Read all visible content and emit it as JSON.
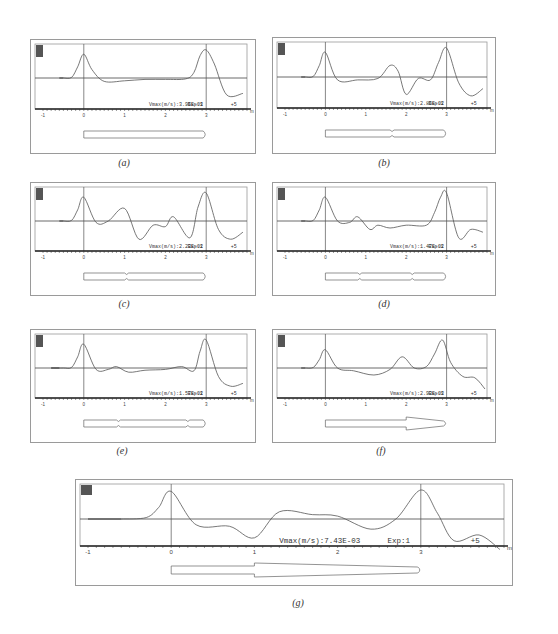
{
  "figure": {
    "panels": [
      {
        "id": "a",
        "caption": "(a)",
        "vmax_label": "Vmax(m/s):3.95E-03",
        "exp_label": "Exp:1",
        "scale_label": "+5",
        "corner_label": "1"
      },
      {
        "id": "b",
        "caption": "(b)",
        "vmax_label": "Vmax(m/s):2.85E-02",
        "exp_label": "Exp:1",
        "scale_label": "+5",
        "corner_label": "1"
      },
      {
        "id": "c",
        "caption": "(c)",
        "vmax_label": "Vmax(m/s):2.23E-02",
        "exp_label": "Exp:1",
        "scale_label": "+5",
        "corner_label": "1"
      },
      {
        "id": "d",
        "caption": "(d)",
        "vmax_label": "Vmax(m/s):1.47E-02",
        "exp_label": "Exp:1",
        "scale_label": "+5",
        "corner_label": "1"
      },
      {
        "id": "e",
        "caption": "(e)",
        "vmax_label": "Vmax(m/s):1.57E-02",
        "exp_label": "Exp:1",
        "scale_label": "+5",
        "corner_label": "1"
      },
      {
        "id": "f",
        "caption": "(f)",
        "vmax_label": "Vmax(m/s):2.93E-03",
        "exp_label": "Exp:1",
        "scale_label": "+5",
        "corner_label": "1"
      },
      {
        "id": "g",
        "caption": "(g)",
        "vmax_label": "Vmax(m/s):7.43E-03",
        "exp_label": "Exp:1",
        "scale_label": "+5",
        "corner_label": "1"
      }
    ],
    "x_ticks": [
      "-1",
      "0",
      "1",
      "2",
      "3",
      "m"
    ]
  },
  "chart_data": [
    {
      "type": "line",
      "title": "(a)",
      "xlabel": "m",
      "xlim": [
        -1,
        4
      ],
      "x_ticks": [
        -1,
        0,
        1,
        2,
        3
      ],
      "annotation": "Vmax(m/s):3.95E-03  Exp:1  +5",
      "series": [
        {
          "name": "velocity",
          "x": [
            -0.5,
            -0.3,
            -0.15,
            0,
            0.2,
            0.5,
            1.0,
            1.5,
            2.0,
            2.5,
            2.7,
            2.85,
            3.0,
            3.2,
            3.5,
            3.9
          ],
          "y": [
            0,
            0.02,
            0.4,
            0.85,
            0.3,
            -0.12,
            -0.1,
            -0.05,
            -0.05,
            -0.03,
            0.2,
            0.8,
            1.0,
            0.5,
            -0.6,
            -0.55
          ]
        }
      ]
    },
    {
      "type": "line",
      "title": "(b)",
      "xlabel": "m",
      "xlim": [
        -1,
        4
      ],
      "x_ticks": [
        -1,
        0,
        1,
        2,
        3
      ],
      "annotation": "Vmax(m/s):2.85E-02  Exp:1  +5",
      "series": [
        {
          "name": "velocity",
          "x": [
            -0.5,
            -0.3,
            -0.15,
            0,
            0.3,
            0.8,
            1.3,
            1.6,
            1.8,
            2.0,
            2.3,
            2.6,
            2.8,
            3.0,
            3.3,
            3.6,
            3.9
          ],
          "y": [
            0,
            0.02,
            0.4,
            0.85,
            -0.1,
            -0.1,
            -0.05,
            0.4,
            0.2,
            -0.6,
            -0.05,
            -0.1,
            0.5,
            1.0,
            -0.2,
            -0.65,
            -0.4
          ]
        }
      ]
    },
    {
      "type": "line",
      "title": "(c)",
      "xlabel": "m",
      "xlim": [
        -1,
        4
      ],
      "x_ticks": [
        -1,
        0,
        1,
        2,
        3
      ],
      "annotation": "Vmax(m/s):2.23E-02  Exp:1  +5",
      "series": [
        {
          "name": "velocity",
          "x": [
            -0.5,
            -0.3,
            -0.15,
            0,
            0.3,
            0.6,
            1.0,
            1.35,
            1.7,
            2.0,
            2.2,
            2.6,
            2.8,
            3.0,
            3.3,
            3.6,
            3.9
          ],
          "y": [
            0,
            0.02,
            0.4,
            0.85,
            -0.05,
            0,
            0.45,
            -0.65,
            -0.15,
            -0.2,
            0.15,
            -0.6,
            0.5,
            1.0,
            -0.3,
            -0.65,
            -0.4
          ]
        }
      ]
    },
    {
      "type": "line",
      "title": "(d)",
      "xlabel": "m",
      "xlim": [
        -1,
        4
      ],
      "x_ticks": [
        -1,
        0,
        1,
        2,
        3
      ],
      "annotation": "Vmax(m/s):1.47E-02  Exp:1  +5",
      "series": [
        {
          "name": "velocity",
          "x": [
            -0.5,
            -0.3,
            -0.15,
            0,
            0.3,
            0.6,
            0.8,
            1.1,
            1.3,
            1.6,
            2.0,
            2.5,
            2.7,
            2.85,
            3.0,
            3.3,
            3.6,
            3.9
          ],
          "y": [
            0,
            0.02,
            0.4,
            0.85,
            0,
            -0.05,
            0.15,
            -0.3,
            -0.15,
            -0.25,
            -0.15,
            -0.15,
            0.3,
            0.85,
            1.0,
            -0.6,
            -0.3,
            -0.4
          ]
        }
      ]
    },
    {
      "type": "line",
      "title": "(e)",
      "xlabel": "m",
      "xlim": [
        -1,
        4
      ],
      "x_ticks": [
        -1,
        0,
        1,
        2,
        3
      ],
      "annotation": "Vmax(m/s):1.57E-02  Exp:1  +5",
      "series": [
        {
          "name": "velocity",
          "x": [
            -0.8,
            -0.5,
            -0.3,
            -0.15,
            0,
            0.3,
            0.6,
            0.8,
            1.1,
            1.5,
            2.0,
            2.4,
            2.7,
            2.85,
            3.0,
            3.3,
            3.6,
            3.9
          ],
          "y": [
            0,
            0,
            0.02,
            0.4,
            0.85,
            -0.05,
            -0.05,
            0.05,
            -0.15,
            -0.08,
            -0.05,
            0.05,
            -0.1,
            0.6,
            1.0,
            -0.3,
            -0.65,
            -0.55
          ]
        }
      ]
    },
    {
      "type": "line",
      "title": "(f)",
      "xlabel": "m",
      "xlim": [
        -1,
        4
      ],
      "x_ticks": [
        -1,
        0,
        1,
        2,
        3
      ],
      "annotation": "Vmax(m/s):2.93E-03  Exp:1  +5",
      "series": [
        {
          "name": "velocity",
          "x": [
            -0.5,
            -0.3,
            -0.15,
            0,
            0.3,
            0.7,
            1.2,
            1.6,
            1.9,
            2.2,
            2.5,
            2.7,
            2.9,
            3.1,
            3.4,
            3.7,
            3.95
          ],
          "y": [
            0,
            0.02,
            0.3,
            0.65,
            0,
            -0.1,
            -0.25,
            -0.05,
            0.4,
            0,
            0.05,
            0.5,
            1.0,
            0.2,
            -0.3,
            -0.35,
            -0.75
          ]
        }
      ]
    },
    {
      "type": "line",
      "title": "(g)",
      "xlabel": "m",
      "xlim": [
        -1,
        4
      ],
      "x_ticks": [
        -1,
        0,
        1,
        2,
        3
      ],
      "annotation": "Vmax(m/s):7.43E-03  Exp:1  +5",
      "series": [
        {
          "name": "velocity",
          "x": [
            -0.6,
            -0.3,
            -0.15,
            0,
            0.3,
            0.7,
            1.0,
            1.3,
            1.7,
            2.0,
            2.4,
            2.7,
            3.0,
            3.2,
            3.4,
            3.7,
            3.95
          ],
          "y": [
            0,
            0.05,
            0.4,
            0.95,
            -0.2,
            -0.25,
            -0.65,
            0.25,
            0.15,
            0.1,
            -0.35,
            0.0,
            1.0,
            0.2,
            -0.75,
            -0.55,
            -1.05
          ]
        }
      ]
    }
  ]
}
